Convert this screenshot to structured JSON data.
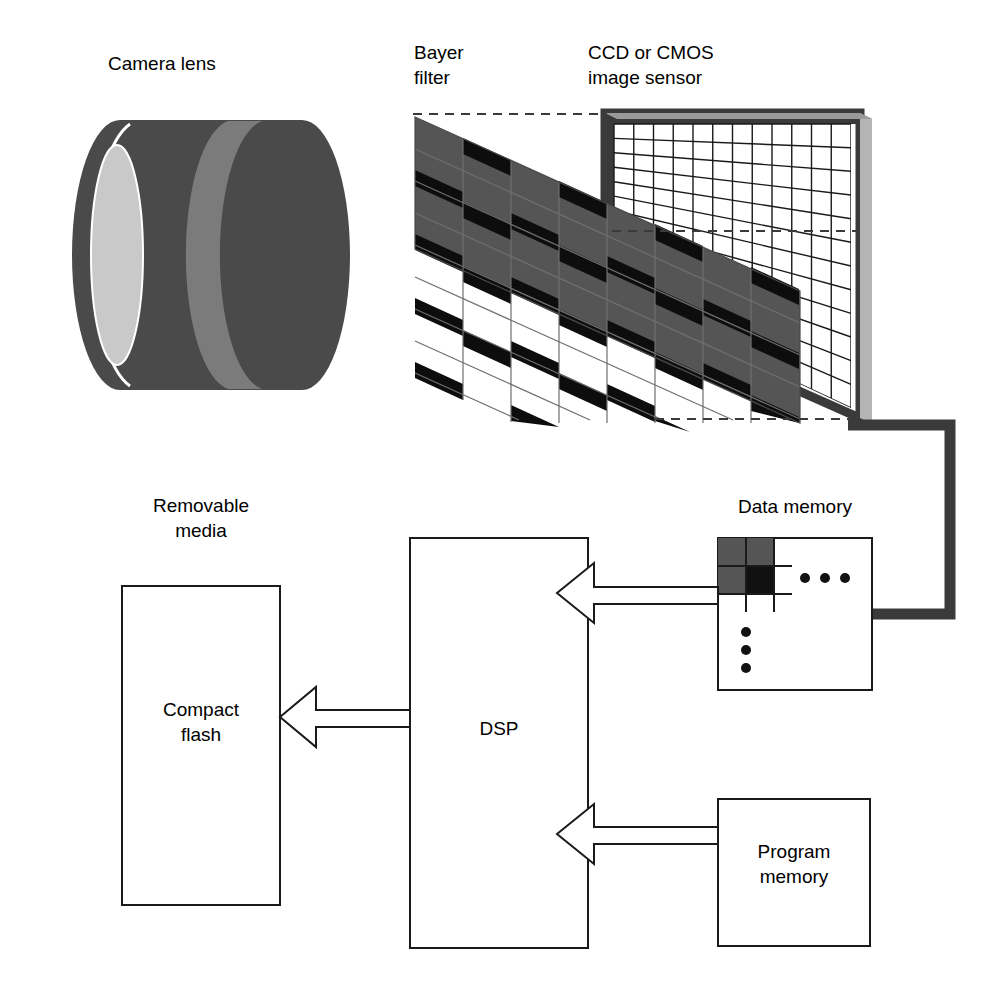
{
  "diagram": {
    "background_color": "#ffffff",
    "line_color": "#1a1a1a",
    "text_color": "#000000"
  },
  "labels": {
    "camera_lens": "Camera lens",
    "bayer_filter_line1": "Bayer",
    "bayer_filter_line2": "filter",
    "sensor_line1": "CCD or CMOS",
    "sensor_line2": "image sensor",
    "data_memory": "Data memory",
    "removable_media_line1": "Removable",
    "removable_media_line2": "media",
    "compact_flash_line1": "Compact",
    "compact_flash_line2": "flash",
    "dsp": "DSP",
    "program_memory_line1": "Program",
    "program_memory_line2": "memory"
  },
  "colors": {
    "lens_body": "#4a4a4a",
    "lens_band": "#7b7b7b",
    "lens_face": "#c9c9c9",
    "lens_rim": "#ffffff",
    "bayer_cell_gray": "#555555",
    "bayer_cell_black": "#0d0d0d",
    "sensor_fill": "#ffffff",
    "sensor_frame": "#3a3a3a",
    "sensor_edge": "#b4b4b4",
    "bus_connector": "#3a3a3a",
    "memory_cell_gray": "#555555",
    "memory_cell_black": "#111111",
    "outline": "#1a1a1a",
    "dashed": "#3a3a3a"
  },
  "geometry": {
    "bayer_cols": 8,
    "bayer_rows": 8,
    "sensor_cols": 12,
    "sensor_rows": 12,
    "data_memory_cells": [
      {
        "row": 0,
        "col": 0,
        "shade": "gray"
      },
      {
        "row": 0,
        "col": 1,
        "shade": "gray"
      },
      {
        "row": 1,
        "col": 0,
        "shade": "gray"
      },
      {
        "row": 1,
        "col": 1,
        "shade": "black"
      }
    ]
  },
  "blocks": [
    {
      "id": "compact-flash",
      "label_key": "compact_flash",
      "x": 122,
      "y": 586,
      "w": 158,
      "h": 319
    },
    {
      "id": "dsp",
      "label_key": "dsp",
      "x": 410,
      "y": 538,
      "w": 178,
      "h": 410
    },
    {
      "id": "data-memory",
      "label_key": "data_memory",
      "x": 718,
      "y": 538,
      "w": 154,
      "h": 152
    },
    {
      "id": "program-memory",
      "label_key": "program_memory",
      "x": 718,
      "y": 799,
      "w": 152,
      "h": 147
    }
  ],
  "arrows": [
    {
      "id": "data-memory-to-dsp",
      "from": "data-memory",
      "to": "dsp",
      "direction": "left"
    },
    {
      "id": "program-memory-to-dsp",
      "from": "program-memory",
      "to": "dsp",
      "direction": "left"
    },
    {
      "id": "dsp-to-compact-flash",
      "from": "dsp",
      "to": "compact-flash",
      "direction": "left"
    }
  ],
  "dots": {
    "horizontal_count": 3,
    "vertical_count": 3
  }
}
